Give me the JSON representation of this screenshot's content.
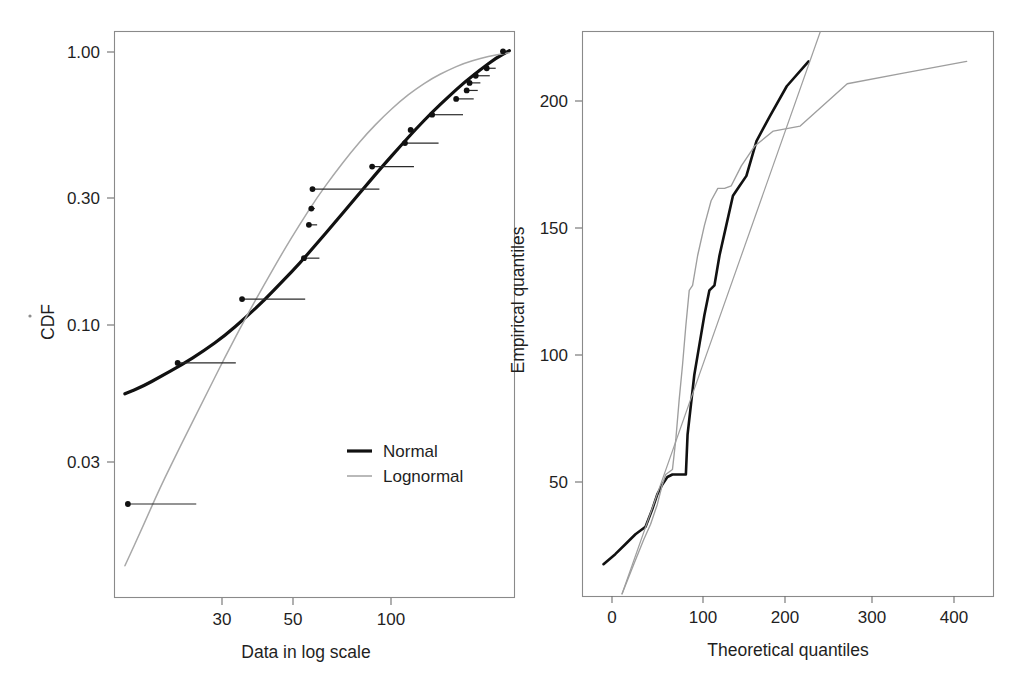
{
  "figure": {
    "background": "#ffffff",
    "panels": [
      "cdf-panel",
      "qq-panel"
    ]
  },
  "colors": {
    "normal": "#111111",
    "lognormal": "#a8a8a8",
    "frame": "#8a8a8a",
    "text": "#1f1f1f"
  },
  "chart_data": [
    {
      "id": "cdf-panel",
      "type": "line",
      "title": "",
      "xlabel": "Data in log scale",
      "ylabel": "CDF",
      "xscale": "log",
      "yscale": "log",
      "xticks": [
        30,
        50,
        100
      ],
      "xtick_labels": [
        "30",
        "50",
        "100"
      ],
      "yticks": [
        1.0,
        0.3,
        0.1,
        0.03
      ],
      "ytick_labels": [
        "1.00",
        "0.30",
        "0.10",
        "0.03"
      ],
      "xlim": [
        12,
        260
      ],
      "ylim": [
        0.012,
        1.15
      ],
      "grid": false,
      "legend": {
        "position": "center-right-lower",
        "entries": [
          {
            "label": "Normal",
            "color": "#111111",
            "width": 3.2
          },
          {
            "label": "Lognormal",
            "color": "#a8a8a8",
            "width": 1.5
          }
        ]
      },
      "series": [
        {
          "name": "Normal",
          "style": "solid-thick",
          "x": [
            13,
            15,
            17,
            20,
            24,
            28,
            33,
            38,
            44,
            50,
            57,
            65,
            74,
            84,
            95,
            108,
            122,
            138,
            156,
            177,
            200,
            226,
            250
          ],
          "y": [
            0.062,
            0.066,
            0.071,
            0.078,
            0.088,
            0.099,
            0.115,
            0.132,
            0.155,
            0.178,
            0.209,
            0.245,
            0.288,
            0.337,
            0.392,
            0.456,
            0.525,
            0.6,
            0.678,
            0.765,
            0.845,
            0.93,
            0.985
          ]
        },
        {
          "name": "Lognormal",
          "style": "solid-thin",
          "x": [
            13,
            15,
            17,
            20,
            24,
            28,
            33,
            38,
            44,
            50,
            57,
            65,
            74,
            84,
            95,
            108,
            122,
            138,
            156,
            177,
            200,
            226,
            250
          ],
          "y": [
            0.0155,
            0.0215,
            0.029,
            0.041,
            0.06,
            0.083,
            0.115,
            0.15,
            0.196,
            0.244,
            0.302,
            0.365,
            0.435,
            0.508,
            0.58,
            0.656,
            0.725,
            0.788,
            0.842,
            0.892,
            0.926,
            0.953,
            0.97
          ]
        },
        {
          "name": "Empirical CDF points",
          "style": "points-with-horizontal-segments",
          "points": [
            {
              "x": 13.3,
              "y": 0.0255,
              "seg_to": 22.5
            },
            {
              "x": 19.5,
              "y": 0.0795,
              "seg_to": 30.5
            },
            {
              "x": 32.0,
              "y": 0.133,
              "seg_to": 52.0
            },
            {
              "x": 51.5,
              "y": 0.185,
              "seg_to": 58.0
            },
            {
              "x": 53.5,
              "y": 0.242,
              "seg_to": 57.0
            },
            {
              "x": 55.0,
              "y": 0.323,
              "seg_to": 92.0
            },
            {
              "x": 54.5,
              "y": 0.276,
              "seg_to": 56.0
            },
            {
              "x": 87.0,
              "y": 0.387,
              "seg_to": 120.0
            },
            {
              "x": 112.0,
              "y": 0.468,
              "seg_to": 145.0
            },
            {
              "x": 117.0,
              "y": 0.52,
              "seg_to": 121.0
            },
            {
              "x": 138.0,
              "y": 0.588,
              "seg_to": 175.0
            },
            {
              "x": 166.0,
              "y": 0.668,
              "seg_to": 190.0
            },
            {
              "x": 180.0,
              "y": 0.715,
              "seg_to": 196.0
            },
            {
              "x": 184.0,
              "y": 0.76,
              "seg_to": 200.0
            },
            {
              "x": 193.0,
              "y": 0.805,
              "seg_to": 215.0
            },
            {
              "x": 210.0,
              "y": 0.855,
              "seg_to": 225.0
            },
            {
              "x": 238.0,
              "y": 0.98,
              "seg_to": 244.0
            }
          ]
        }
      ]
    },
    {
      "id": "qq-panel",
      "type": "line",
      "title": "",
      "xlabel": "Theoretical quantiles",
      "ylabel": "Empirical quantiles",
      "xscale": "linear",
      "yscale": "linear",
      "xticks": [
        0,
        100,
        200,
        300,
        400
      ],
      "xtick_labels": [
        "0",
        "100",
        "200",
        "300",
        "400"
      ],
      "yticks": [
        50,
        100,
        150,
        200
      ],
      "ytick_labels": [
        "50",
        "100",
        "150",
        "200"
      ],
      "xlim": [
        -37,
        452
      ],
      "ylim": [
        3,
        230
      ],
      "grid": false,
      "series": [
        {
          "name": "Normal",
          "style": "solid-thick",
          "x": [
            -12,
            2,
            14,
            26,
            38,
            46,
            52,
            58,
            64,
            70,
            78,
            86,
            88,
            92,
            96,
            102,
            108,
            114,
            120,
            126,
            134,
            142,
            150,
            158,
            170,
            186,
            206,
            232
          ],
          "y": [
            16,
            20,
            24,
            28,
            31,
            38,
            44,
            48,
            51,
            52,
            52,
            52,
            68,
            80,
            92,
            104,
            116,
            126,
            128,
            140,
            152,
            164,
            168,
            172,
            186,
            196,
            208,
            218
          ]
        },
        {
          "name": "Lognormal",
          "style": "solid-thin",
          "x": [
            10,
            24,
            36,
            44,
            52,
            58,
            62,
            66,
            70,
            74,
            78,
            82,
            86,
            90,
            94,
            100,
            108,
            116,
            124,
            132,
            140,
            152,
            168,
            190,
            222,
            278,
            340,
            420
          ],
          "y": [
            4,
            16,
            26,
            32,
            40,
            48,
            52,
            53,
            54,
            66,
            82,
            96,
            112,
            126,
            128,
            140,
            152,
            162,
            167,
            167,
            168,
            176,
            184,
            190,
            192,
            209,
            213,
            218
          ]
        },
        {
          "name": "Reference line",
          "style": "straight-thin",
          "x": [
            10,
            246
          ],
          "y": [
            4,
            230
          ]
        }
      ]
    }
  ],
  "panels": {
    "cdf": {
      "ylabel": "CDF",
      "xlabel": "Data in log scale",
      "yticks": [
        "1.00",
        "0.30",
        "0.10",
        "0.03"
      ],
      "xticks": [
        "30",
        "50",
        "100"
      ],
      "legend": {
        "normal": "Normal",
        "lognormal": "Lognormal"
      }
    },
    "qq": {
      "ylabel": "Empirical quantiles",
      "xlabel": "Theoretical quantiles",
      "yticks": [
        "200",
        "150",
        "100",
        "50"
      ],
      "xticks": [
        "0",
        "100",
        "200",
        "300",
        "400"
      ]
    }
  }
}
